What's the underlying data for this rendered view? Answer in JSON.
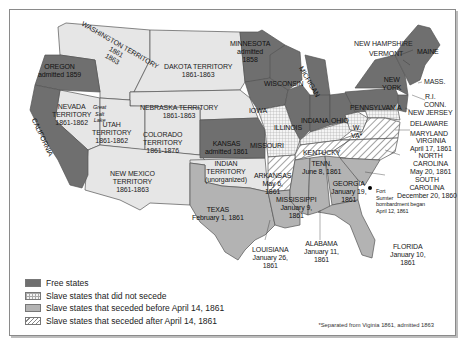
{
  "colors": {
    "free": "#6f6f6f",
    "territory": "#e6e6e6",
    "seceded_before": "#b3b3b3",
    "no_secede_bg": "#f4f4f4",
    "border": "#555555"
  },
  "labels": {
    "washington": "WASHINGTON TERRITORY\n1861\n1863",
    "oregon": "OREGON\nadmitted 1859",
    "california": "CALIFORNIA",
    "nevada": "NEVADA\nTERRITORY\n1861-1862",
    "great_salt_lake": "Great\nSalt\nLake",
    "utah": "UTAH\nTERRITORY\n1861-1862",
    "dakota": "DAKOTA TERRITORY\n1861-1863",
    "nebraska": "NEBRASKA TERRITORY\n1861-1863",
    "colorado": "COLORADO\nTERRITORY\n1861-1876",
    "new_mexico": "NEW MEXICO\nTERRITORY\n1861-1863",
    "kansas": "KANSAS\nadmitted 1861",
    "indian": "INDIAN\nTERRITORY\n(unorganized)",
    "minnesota": "MINNESOTA\nadmitted\n1858",
    "wisconsin": "WISCONSIN",
    "iowa": "IOWA",
    "michigan": "MICHIGAN",
    "illinois": "ILLINOIS",
    "indiana": "INDIANA",
    "ohio": "OHIO",
    "missouri": "MISSOURI",
    "kentucky": "KENTUCKY",
    "west_virginia": "W.\nVA*",
    "pennsylvania": "PENNSYLVANIA",
    "new_york": "NEW\nYORK",
    "new_hampshire": "NEW HAMPSHIRE",
    "vermont": "VERMONT",
    "maine": "MAINE",
    "mass": "MASS.",
    "ri": "R.I.",
    "conn": "CONN.",
    "new_jersey": "NEW JERSEY",
    "delaware": "DELAWARE",
    "maryland": "MARYLAND",
    "virginia": "VIRGINIA\nApril 17, 1861",
    "north_carolina": "NORTH\nCAROLINA\nMay 20, 1861",
    "south_carolina": "SOUTH\nCAROLINA\nDecember 20, 1860",
    "fort_sumter": "Fort\nSumter\nbombardment began\nApril 12, 1861",
    "tennessee": "TENN.\nJune 8, 1861",
    "arkansas": "ARKANSAS\nMay 6,\n1861",
    "texas": "TEXAS\nFebruary 1, 1861",
    "louisiana": "LOUISIANA\nJanuary 26,\n1861",
    "mississippi": "MISSISSIPPI\nJanuary 9,\n1861",
    "alabama": "ALABAMA\nJanuary 11,\n1861",
    "georgia": "GEORGIA\nJanuary 19,\n1861",
    "florida": "FLORIDA\nJanuary 10,\n1861"
  },
  "legend": [
    {
      "key": "free",
      "label": "Free states"
    },
    {
      "key": "nosec",
      "label": "Slave states that did not secede"
    },
    {
      "key": "before",
      "label": "Slave states that seceded before April 14, 1861"
    },
    {
      "key": "after",
      "label": "Slave states that seceded after April 14, 1861"
    }
  ],
  "footnote": "*Separated from Viginia 1861, admitted 1863"
}
